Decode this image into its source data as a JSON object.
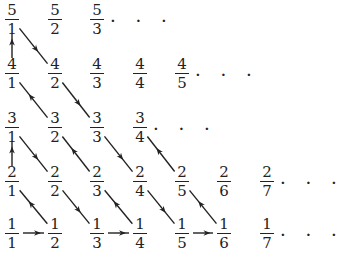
{
  "layout": {
    "col_x": [
      12,
      55,
      97,
      140,
      182,
      224,
      267
    ],
    "row_y": {
      "1": 233,
      "2": 181,
      "3": 127,
      "4": 73,
      "5": 19
    }
  },
  "fractions": [
    {
      "n": 1,
      "d": 1
    },
    {
      "n": 1,
      "d": 2
    },
    {
      "n": 1,
      "d": 3
    },
    {
      "n": 1,
      "d": 4
    },
    {
      "n": 1,
      "d": 5
    },
    {
      "n": 1,
      "d": 6
    },
    {
      "n": 1,
      "d": 7
    },
    {
      "n": 2,
      "d": 1
    },
    {
      "n": 2,
      "d": 2
    },
    {
      "n": 2,
      "d": 3
    },
    {
      "n": 2,
      "d": 4
    },
    {
      "n": 2,
      "d": 5
    },
    {
      "n": 2,
      "d": 6
    },
    {
      "n": 2,
      "d": 7
    },
    {
      "n": 3,
      "d": 1
    },
    {
      "n": 3,
      "d": 2
    },
    {
      "n": 3,
      "d": 3
    },
    {
      "n": 3,
      "d": 4
    },
    {
      "n": 4,
      "d": 1
    },
    {
      "n": 4,
      "d": 2
    },
    {
      "n": 4,
      "d": 3
    },
    {
      "n": 4,
      "d": 4
    },
    {
      "n": 4,
      "d": 5
    },
    {
      "n": 5,
      "d": 1
    },
    {
      "n": 5,
      "d": 2
    },
    {
      "n": 5,
      "d": 3
    }
  ],
  "ellipses": [
    {
      "after": "5/3",
      "text": "..."
    },
    {
      "after": "4/5",
      "text": "..."
    },
    {
      "after": "3/4",
      "text": "..."
    },
    {
      "after": "2/7",
      "text": "..."
    },
    {
      "after": "1/7",
      "text": "..."
    }
  ],
  "arrows": [
    {
      "from": "1/1",
      "to": "1/2"
    },
    {
      "from": "1/2",
      "to": "2/1"
    },
    {
      "from": "2/1",
      "to": "3/1"
    },
    {
      "from": "3/1",
      "to": "2/2"
    },
    {
      "from": "2/2",
      "to": "1/3"
    },
    {
      "from": "1/3",
      "to": "1/4"
    },
    {
      "from": "1/4",
      "to": "2/3"
    },
    {
      "from": "2/3",
      "to": "3/2"
    },
    {
      "from": "3/2",
      "to": "4/1"
    },
    {
      "from": "4/1",
      "to": "5/1"
    },
    {
      "from": "5/1",
      "to": "4/2"
    },
    {
      "from": "4/2",
      "to": "3/3"
    },
    {
      "from": "3/3",
      "to": "2/4"
    },
    {
      "from": "2/4",
      "to": "1/5"
    },
    {
      "from": "1/5",
      "to": "1/6"
    },
    {
      "from": "1/6",
      "to": "2/5"
    },
    {
      "from": "2/5",
      "to": "3/4"
    }
  ],
  "colors": {
    "ink": "#222222",
    "background": "#ffffff"
  }
}
